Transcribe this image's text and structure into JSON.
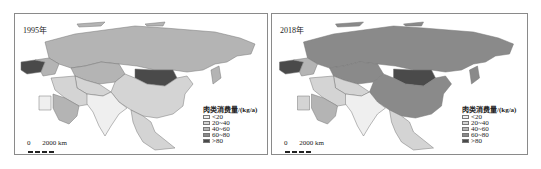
{
  "panels": [
    {
      "year_label": "1995年",
      "legend": {
        "title": "肉类消费量/(kg/a)",
        "items": [
          {
            "label": "<20",
            "color": "#efefef"
          },
          {
            "label": "20~40",
            "color": "#d4d4d4"
          },
          {
            "label": "40~60",
            "color": "#b4b4b4"
          },
          {
            "label": "60~80",
            "color": "#8a8a8a"
          },
          {
            "label": ">80",
            "color": "#4a4a4a"
          }
        ]
      },
      "scale": {
        "zero": "0",
        "distance": "2000 km"
      },
      "regions": {
        "russia": "#b4b4b4",
        "kazakhstan": "#b4b4b4",
        "mongolia": "#4a4a4a",
        "china": "#d4d4d4",
        "india": "#efefef",
        "southeast_asia": "#d4d4d4",
        "middle_east": "#d4d4d4",
        "saudi_arabia": "#b4b4b4",
        "europe_west": "#4a4a4a",
        "japan": "#b4b4b4"
      }
    },
    {
      "year_label": "2018年",
      "legend": {
        "title": "肉类消费量/(kg/a)",
        "items": [
          {
            "label": "<20",
            "color": "#efefef"
          },
          {
            "label": "20~40",
            "color": "#d4d4d4"
          },
          {
            "label": "40~60",
            "color": "#b4b4b4"
          },
          {
            "label": "60~80",
            "color": "#8a8a8a"
          },
          {
            "label": ">80",
            "color": "#4a4a4a"
          }
        ]
      },
      "scale": {
        "zero": "0",
        "distance": "2000 km"
      },
      "regions": {
        "russia": "#8a8a8a",
        "kazakhstan": "#8a8a8a",
        "mongolia": "#4a4a4a",
        "china": "#8a8a8a",
        "india": "#efefef",
        "southeast_asia": "#d4d4d4",
        "middle_east": "#d4d4d4",
        "saudi_arabia": "#b4b4b4",
        "europe_west": "#4a4a4a",
        "japan": "#8a8a8a"
      }
    }
  ]
}
